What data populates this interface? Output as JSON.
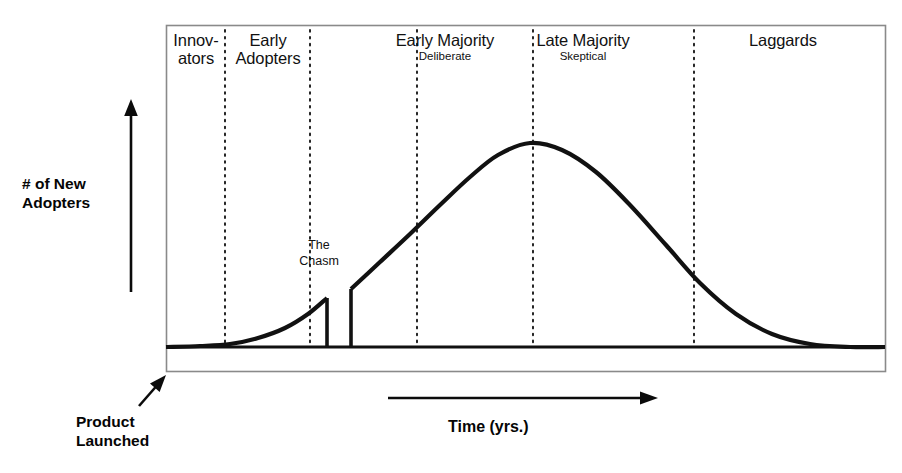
{
  "figure": {
    "frame": {
      "x": 166,
      "y": 25,
      "width": 719,
      "height": 346
    },
    "ink_color": "#111111",
    "frame_color": "#8a8a8a"
  },
  "segments": [
    {
      "id": "innovators",
      "label": "Innovators",
      "label_lines": "Innov-\nators",
      "sublabel": "",
      "center_x": 196,
      "start_x": 166,
      "end_x": 225
    },
    {
      "id": "early-adopters",
      "label": "Early Adopters",
      "label_lines": "Early\nAdopters",
      "sublabel": "",
      "center_x": 268,
      "start_x": 225,
      "end_x": 310
    },
    {
      "id": "early-majority",
      "label": "Early Majority",
      "label_lines": "Early Majority",
      "sublabel": "Deliberate",
      "center_x": 445,
      "start_x": 310,
      "end_x": 533
    },
    {
      "id": "late-majority",
      "label": "Late Majority",
      "label_lines": "Late Majority",
      "sublabel": "Skeptical",
      "center_x": 583,
      "start_x": 533,
      "end_x": 694
    },
    {
      "id": "laggards",
      "label": "Laggards",
      "label_lines": "Laggards",
      "sublabel": "",
      "center_x": 783,
      "start_x": 694,
      "end_x": 885
    }
  ],
  "dividers_x": [
    225,
    310,
    417,
    533,
    694
  ],
  "annotations": {
    "y_axis_label": "# of New\nAdopters",
    "x_axis_label": "Time (yrs.)",
    "chasm_label": "The\nChasm",
    "launch_label": "Product\nLaunched"
  },
  "chart_data": {
    "type": "area",
    "xlabel": "Time (yrs.)",
    "ylabel": "# of New Adopters",
    "grid": false,
    "legend": null,
    "annotations": [
      "The Chasm",
      "Product Launched"
    ],
    "baseline_y": 347,
    "peak": {
      "x": 530,
      "y": 143,
      "label": "Early/Late Majority peak"
    },
    "early_adopter_peak": {
      "x": 327,
      "y": 298
    },
    "chasm_gap": {
      "start_x": 330,
      "end_x": 351
    },
    "resume_point": {
      "x": 351,
      "y": 289
    },
    "curve_points": [
      {
        "x": 166,
        "y": 347
      },
      {
        "x": 200,
        "y": 346
      },
      {
        "x": 230,
        "y": 344
      },
      {
        "x": 258,
        "y": 338
      },
      {
        "x": 285,
        "y": 328
      },
      {
        "x": 308,
        "y": 314
      },
      {
        "x": 327,
        "y": 298
      },
      {
        "x": 327,
        "y": 347
      },
      {
        "x": 351,
        "y": 347
      },
      {
        "x": 351,
        "y": 289
      },
      {
        "x": 380,
        "y": 262
      },
      {
        "x": 410,
        "y": 234
      },
      {
        "x": 440,
        "y": 205
      },
      {
        "x": 470,
        "y": 177
      },
      {
        "x": 498,
        "y": 155
      },
      {
        "x": 530,
        "y": 143
      },
      {
        "x": 562,
        "y": 150
      },
      {
        "x": 596,
        "y": 172
      },
      {
        "x": 630,
        "y": 205
      },
      {
        "x": 666,
        "y": 245
      },
      {
        "x": 700,
        "y": 283
      },
      {
        "x": 736,
        "y": 314
      },
      {
        "x": 772,
        "y": 334
      },
      {
        "x": 810,
        "y": 344
      },
      {
        "x": 850,
        "y": 347
      },
      {
        "x": 885,
        "y": 347
      }
    ]
  },
  "arrows": {
    "y_axis": {
      "x": 131,
      "y_bottom": 292,
      "y_top": 99
    },
    "x_axis": {
      "y": 398,
      "x_start": 388,
      "x_end": 658
    },
    "launch": {
      "x_start": 139,
      "y_start": 406,
      "x_end": 166,
      "y_end": 375
    }
  }
}
